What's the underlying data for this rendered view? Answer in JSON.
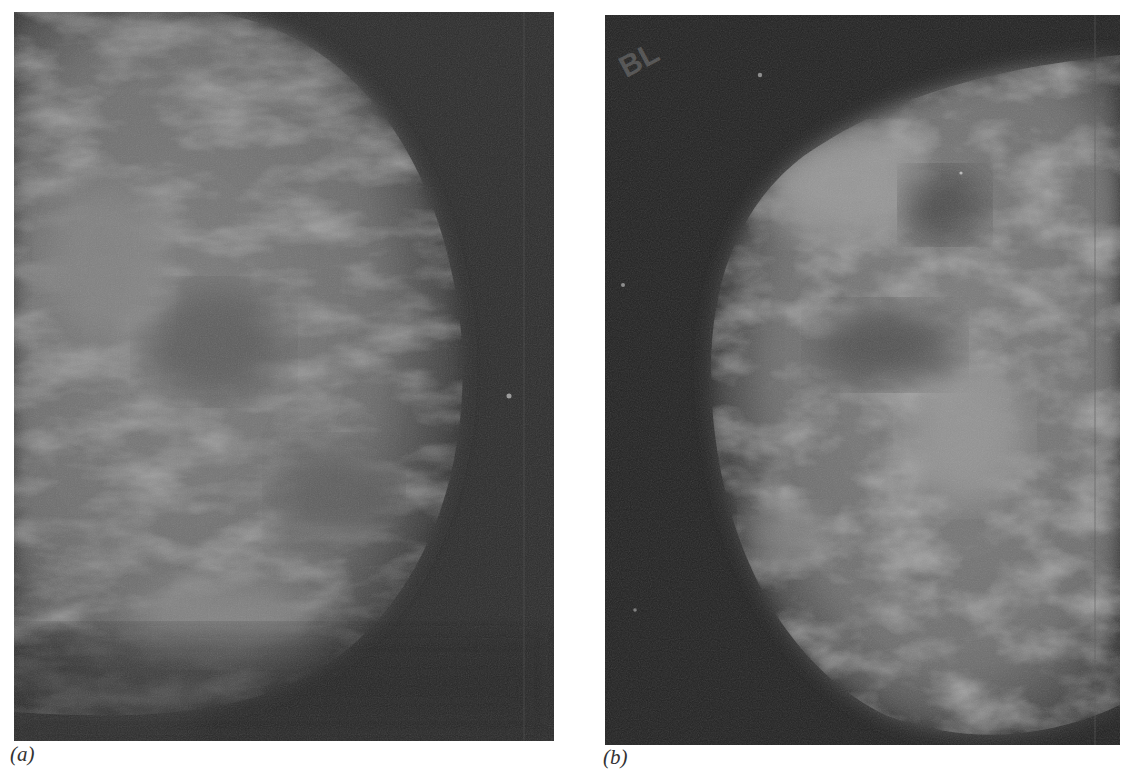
{
  "figure": {
    "panels": [
      {
        "id": "a",
        "label": "(a)",
        "content": "mammogram-grayscale",
        "background_color": "#2b2b2b",
        "tissue_color": "#7a7a7a"
      },
      {
        "id": "b",
        "label": "(b)",
        "content": "mammogram-grayscale",
        "marker_text": "BL",
        "background_color": "#232323",
        "tissue_color": "#8a8a8a"
      }
    ]
  }
}
